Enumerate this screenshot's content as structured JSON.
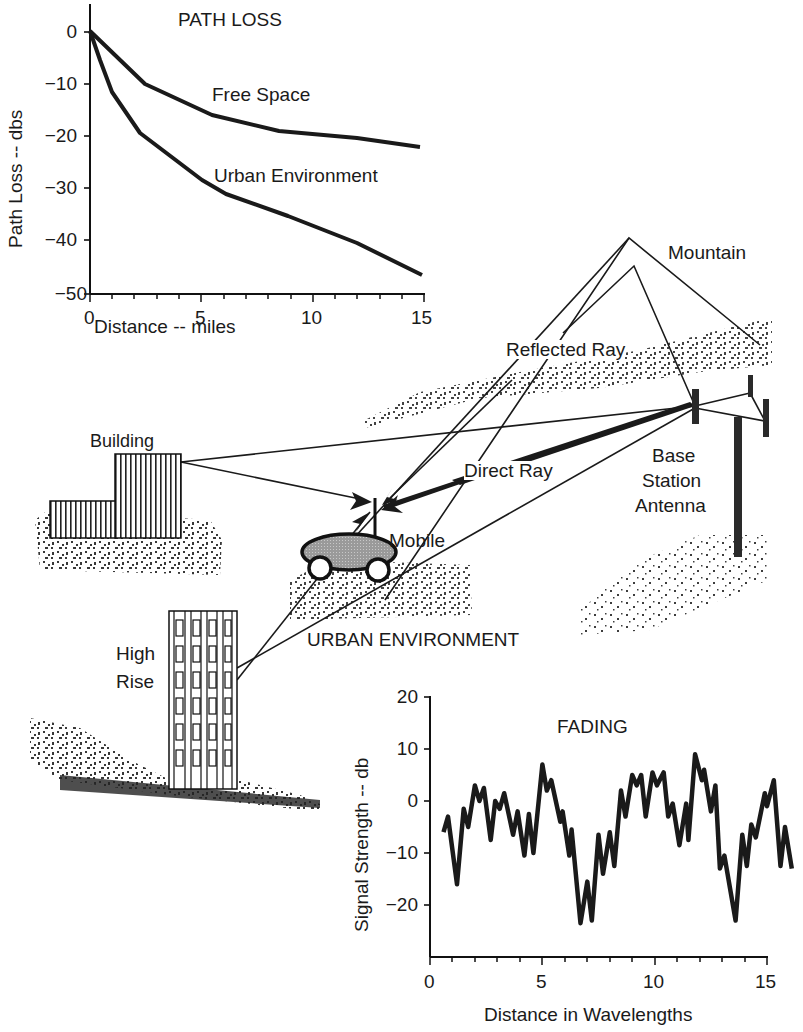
{
  "path_loss_chart": {
    "title": "PATH LOSS",
    "xlabel": "Distance -- miles",
    "ylabel": "Path Loss -- dbs",
    "x_ticks": [
      "0",
      "5",
      "10",
      "15"
    ],
    "y_ticks": [
      "0",
      "−10",
      "−20",
      "−30",
      "−40",
      "−50"
    ],
    "series_labels": [
      "Free Space",
      "Urban Environment"
    ]
  },
  "fading_chart": {
    "title": "FADING",
    "xlabel": "Distance in Wavelengths",
    "ylabel": "Signal Strength -- db",
    "x_ticks": [
      "0",
      "5",
      "10",
      "15"
    ],
    "y_ticks": [
      "20",
      "10",
      "0",
      "−10",
      "−20"
    ]
  },
  "diagram": {
    "labels": {
      "mountain": "Mountain",
      "reflected_ray": "Reflected Ray",
      "building": "Building",
      "direct_ray": "Direct Ray",
      "base": "Base",
      "station": "Station",
      "antenna": "Antenna",
      "mobile": "Mobile",
      "urban_environment": "URBAN ENVIRONMENT",
      "high": "High",
      "rise": "Rise"
    }
  },
  "chart_data": [
    {
      "type": "line",
      "title": "PATH LOSS",
      "xlabel": "Distance -- miles",
      "ylabel": "Path Loss -- dbs",
      "xlim": [
        0,
        15
      ],
      "ylim": [
        -50,
        0
      ],
      "grid": false,
      "x_ticks": [
        0,
        5,
        10,
        15
      ],
      "y_ticks": [
        0,
        -10,
        -20,
        -30,
        -40,
        -50
      ],
      "series": [
        {
          "name": "Free Space",
          "x": [
            0,
            2.5,
            5.5,
            8.5,
            12,
            15
          ],
          "values": [
            0,
            -10,
            -16,
            -19,
            -20.5,
            -22
          ]
        },
        {
          "name": "Urban Environment",
          "x": [
            0,
            1,
            2.5,
            4,
            5.5,
            6.5,
            9,
            12,
            15
          ],
          "values": [
            0,
            -11.5,
            -19.5,
            -25,
            -30,
            -32.5,
            -36.5,
            -41.5,
            -47
          ]
        }
      ],
      "legend": "inline labels"
    },
    {
      "type": "line",
      "title": "FADING",
      "xlabel": "Distance in Wavelengths",
      "ylabel": "Signal Strength -- db",
      "xlim": [
        0,
        16
      ],
      "ylim": [
        -30,
        20
      ],
      "grid": false,
      "x_ticks": [
        0,
        5,
        10,
        15
      ],
      "y_ticks": [
        20,
        10,
        0,
        -10,
        -20
      ],
      "series": [
        {
          "name": "Signal Strength",
          "x": [
            0.6,
            0.8,
            1.2,
            1.5,
            1.7,
            2.0,
            2.2,
            2.4,
            2.7,
            2.9,
            3.1,
            3.3,
            3.7,
            3.9,
            4.2,
            4.4,
            4.6,
            5.0,
            5.2,
            5.4,
            5.8,
            5.9,
            6.2,
            6.3,
            6.7,
            7.0,
            7.2,
            7.5,
            7.7,
            8.0,
            8.2,
            8.5,
            8.7,
            9.0,
            9.2,
            9.4,
            9.6,
            9.9,
            10.1,
            10.4,
            10.6,
            10.8,
            11.1,
            11.4,
            11.5,
            11.8,
            12.1,
            12.2,
            12.5,
            12.7,
            12.9,
            13.1,
            13.6,
            13.9,
            14.1,
            14.3,
            14.5,
            14.9,
            15.0,
            15.3,
            15.6,
            15.8,
            16.1
          ],
          "values": [
            -6,
            -3,
            -16,
            -1.5,
            -5,
            3,
            0,
            2.5,
            -7.5,
            0,
            -1.5,
            1.5,
            -6.5,
            -2,
            -10.5,
            -2.5,
            -10,
            7,
            2,
            4,
            -4,
            -2,
            -10.5,
            -5.5,
            -23.5,
            -15.5,
            -23,
            -6.5,
            -14,
            -6,
            -12.5,
            2,
            -3,
            5,
            3,
            5,
            -3,
            5.5,
            3,
            5.5,
            -3,
            -0.5,
            -8.5,
            -0.5,
            -7.5,
            9,
            4,
            6,
            -2,
            3,
            -13,
            -10.5,
            -23,
            -6.5,
            -12.5,
            -4.5,
            -7,
            1.5,
            -1,
            4,
            -12.5,
            -5,
            -13
          ]
        }
      ]
    }
  ]
}
